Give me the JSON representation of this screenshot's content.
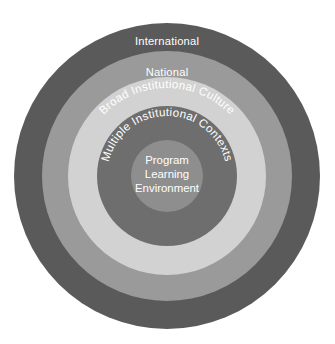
{
  "figure": {
    "background_color": "#ffffff",
    "center_x": 167,
    "center_y": 176
  },
  "rings": [
    {
      "id": "international",
      "label": "International",
      "level": 1,
      "radius": 153,
      "color": "#5a5a5a",
      "text_color": "#ffffff",
      "text_style": "straight",
      "label_x": 167,
      "label_y": 42
    },
    {
      "id": "national",
      "label": "National",
      "level": 2,
      "radius": 125,
      "color": "#9a9a9a",
      "text_color": "#ffffff",
      "text_style": "straight",
      "label_x": 167,
      "label_y": 73
    },
    {
      "id": "broad-institutional-culture",
      "label": "Broad Institutional Culture",
      "level": 3,
      "radius": 99,
      "color": "#d2d2d2",
      "text_color": "#ffffff",
      "text_style": "curved",
      "text_path_radius": 88
    },
    {
      "id": "multiple-institutional-contexts",
      "label": "Multiple Institutional Contexts",
      "level": 4,
      "radius": 70,
      "color": "#6e6e6e",
      "text_color": "#ffffff",
      "text_style": "curved",
      "text_path_radius": 60
    },
    {
      "id": "program-learning-environment",
      "label": "Program Learning Environment",
      "level": 5,
      "radius": 36,
      "color": "#8e8e8e",
      "text_color": "#ffffff",
      "text_style": "stacked",
      "label_lines": [
        "Program",
        "Learning",
        "Environment"
      ]
    }
  ],
  "core": {
    "line1": "Program",
    "line2": "Learning",
    "line3": "Environment"
  }
}
